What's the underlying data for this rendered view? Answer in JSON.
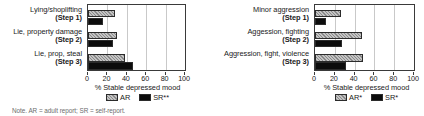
{
  "figure": {
    "note": "Note. AR = adult report; SR = self-report."
  },
  "panels": [
    {
      "id": "left",
      "axis_title": "% Stable depressed mood",
      "tick_labels": [
        "0",
        "20",
        "40",
        "60",
        "80",
        "100"
      ],
      "legend": [
        {
          "key": "AR",
          "label": "AR"
        },
        {
          "key": "SR",
          "label": "SR**"
        }
      ],
      "categories": [
        {
          "name": "Lying/shoplifting",
          "step": "(Step 1)"
        },
        {
          "name": "Lie, property damage",
          "step": "(Step 2)"
        },
        {
          "name": "Lie, prop, steal",
          "step": "(Step 3)"
        }
      ]
    },
    {
      "id": "right",
      "axis_title": "% Stable depressed mood",
      "tick_labels": [
        "0",
        "20",
        "40",
        "60",
        "80",
        "100"
      ],
      "legend": [
        {
          "key": "AR",
          "label": "AR*"
        },
        {
          "key": "SR",
          "label": "SR*"
        }
      ],
      "categories": [
        {
          "name": "Minor aggression",
          "step": "(Step 1)"
        },
        {
          "name": "Aggession, fighting",
          "step": "(Step 2)"
        },
        {
          "name": "Aggression, fight, violence",
          "step": "(Step 3)"
        }
      ]
    }
  ],
  "chart_data": [
    {
      "type": "bar",
      "orientation": "horizontal",
      "title": "",
      "xlabel": "% Stable depressed mood",
      "ylabel": "",
      "xlim": [
        0,
        100
      ],
      "xticks": [
        0,
        20,
        40,
        60,
        80,
        100
      ],
      "grid": true,
      "legend_position": "bottom",
      "categories": [
        "Lying/shoplifting (Step 1)",
        "Lie, property damage (Step 2)",
        "Lie, prop, steal (Step 3)"
      ],
      "series": [
        {
          "name": "AR",
          "values": [
            28,
            30,
            38
          ],
          "color": "#a8a8a8",
          "pattern": "diagonal-hatch"
        },
        {
          "name": "SR**",
          "values": [
            15,
            26,
            46
          ],
          "color": "#0c0c0c",
          "pattern": "solid"
        }
      ]
    },
    {
      "type": "bar",
      "orientation": "horizontal",
      "title": "",
      "xlabel": "% Stable depressed mood",
      "ylabel": "",
      "xlim": [
        0,
        100
      ],
      "xticks": [
        0,
        20,
        40,
        60,
        80,
        100
      ],
      "grid": true,
      "legend_position": "bottom",
      "categories": [
        "Minor aggression (Step 1)",
        "Aggession, fighting (Step 2)",
        "Aggression, fight, violence (Step 3)"
      ],
      "series": [
        {
          "name": "AR*",
          "values": [
            26,
            47,
            48
          ],
          "color": "#a8a8a8",
          "pattern": "diagonal-hatch"
        },
        {
          "name": "SR*",
          "values": [
            11,
            27,
            31
          ],
          "color": "#0c0c0c",
          "pattern": "solid"
        }
      ]
    }
  ]
}
